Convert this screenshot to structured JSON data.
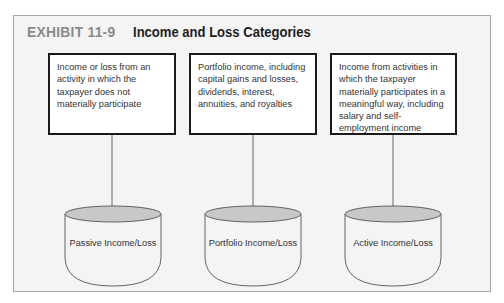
{
  "exhibit": {
    "label": "EXHIBIT 11-9",
    "title": "Income and Loss Categories"
  },
  "categories": [
    {
      "description": "Income or loss from an activity in which the taxpayer does not materially participate",
      "bucket_label": "Passive Income/Loss"
    },
    {
      "description": "Portfolio income, including capital gains and losses, dividends, interest, annuities, and royalties",
      "bucket_label": "Portfolio Income/Loss"
    },
    {
      "description": "Income from activities in which the taxpayer materially participates in a meaningful way, including salary and self-employment income",
      "bucket_label": "Active Income/Loss"
    }
  ],
  "colors": {
    "frame_background": "#f4f4f4",
    "frame_border": "#a8a8a8",
    "exhibit_label": "#8a8a8a",
    "title": "#1e1e1e",
    "box_border": "#1a1a1a",
    "cylinder_top_fill": "#c8c8c8",
    "cylinder_stroke": "#555555"
  }
}
